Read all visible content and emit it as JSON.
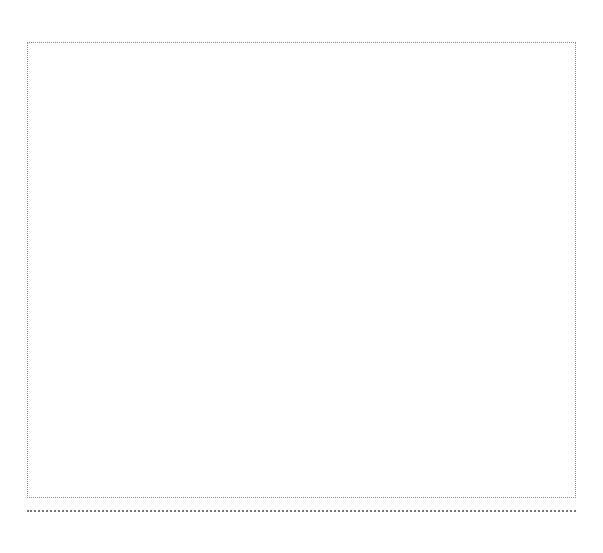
{
  "page": {
    "background": "#ffffff"
  },
  "frame": {
    "border_style": "dotted",
    "border_color": "#8a8a8a",
    "content": ""
  },
  "separator": {
    "style": "dotted",
    "color": "#777777"
  }
}
